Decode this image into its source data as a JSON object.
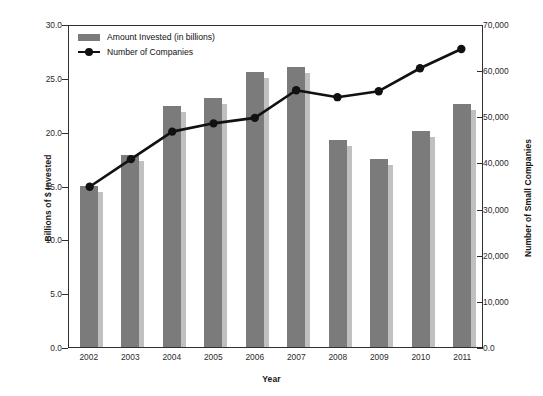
{
  "chart_data": {
    "type": "bar",
    "title": "",
    "subtitle": "",
    "xlabel": "Year",
    "ylabel": "Billions of $ Invested",
    "y2label": "Number of Small Companies",
    "categories": [
      "2002",
      "2003",
      "2004",
      "2005",
      "2006",
      "2007",
      "2008",
      "2009",
      "2010",
      "2011"
    ],
    "series": [
      {
        "name": "Amount Invested (in billions)",
        "type": "bar",
        "axis": "left",
        "color": "#7b7b7b",
        "values": [
          15.0,
          17.8,
          22.4,
          23.1,
          25.5,
          26.0,
          19.2,
          17.5,
          20.1,
          22.6
        ]
      },
      {
        "name": "Number of Companies",
        "type": "line",
        "axis": "right",
        "color": "#111111",
        "values": [
          35000,
          41000,
          47000,
          48800,
          50000,
          56000,
          54500,
          55800,
          60800,
          65000
        ]
      }
    ],
    "ylim": [
      0.0,
      30.0
    ],
    "y2lim": [
      0,
      70000
    ],
    "ytick_labels": [
      "0.0",
      "5.0",
      "10.0",
      "15.0",
      "20.0",
      "25.0",
      "30.0"
    ],
    "ytick_values": [
      0,
      5,
      10,
      15,
      20,
      25,
      30
    ],
    "y2tick_labels": [
      "0.0",
      "10,000",
      "20,000",
      "30,000",
      "40,000",
      "50,000",
      "60,000",
      "70,000"
    ],
    "y2tick_values": [
      0,
      10000,
      20000,
      30000,
      40000,
      50000,
      60000,
      70000
    ],
    "grid": false,
    "legend_position": "top-left-inside",
    "legend": [
      {
        "label": "Amount Invested (in billions)",
        "marker": "bar-swatch",
        "color": "#7b7b7b"
      },
      {
        "label": "Number of Companies",
        "marker": "line-circle",
        "color": "#111111"
      }
    ]
  }
}
